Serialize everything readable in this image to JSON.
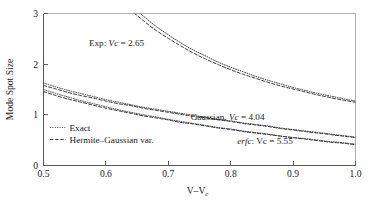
{
  "figure": {
    "background_color": "#ffffff",
    "line_color": "#3a3a3c",
    "axis_color": "#58585a"
  },
  "chart_data": {
    "type": "line",
    "title": "",
    "subtitle": "",
    "xlabel": "V–V",
    "xlabel_sub": "c",
    "ylabel": "Mode Spot Size",
    "xlim": [
      0.5,
      1.0
    ],
    "ylim": [
      0,
      3
    ],
    "grid": false,
    "legend_position": "inside-lower-left",
    "xticks": [
      "0.5",
      "0.6",
      "0.7",
      "0.8",
      "0.9",
      "1.0"
    ],
    "xtick_values": [
      0.5,
      0.6,
      0.7,
      0.8,
      0.9,
      1.0
    ],
    "yticks": [
      "0",
      "1",
      "2",
      "3"
    ],
    "ytick_values": [
      0,
      1,
      2,
      3
    ],
    "series": [
      {
        "name": "Exp: Vc = 2.65 (Exact)",
        "style": "exact",
        "x": [
          0.5,
          0.52,
          0.54,
          0.56,
          0.58,
          0.6,
          0.62,
          0.64,
          0.66,
          0.68,
          0.7,
          0.72,
          0.74,
          0.76,
          0.78,
          0.8,
          0.82,
          0.84,
          0.86,
          0.88,
          0.9,
          0.92,
          0.94,
          0.96,
          0.98,
          1.0
        ],
        "values": [
          6.1,
          5.45,
          4.9,
          4.44,
          4.05,
          3.71,
          3.42,
          3.17,
          2.95,
          2.75,
          2.58,
          2.42,
          2.28,
          2.16,
          2.04,
          1.94,
          1.85,
          1.76,
          1.68,
          1.61,
          1.54,
          1.48,
          1.42,
          1.37,
          1.32,
          1.27
        ]
      },
      {
        "name": "Exp: Vc = 2.65 (Hermite-Gaussian var.)",
        "style": "hermite-gaussian",
        "x": [
          0.5,
          0.52,
          0.54,
          0.56,
          0.58,
          0.6,
          0.62,
          0.64,
          0.66,
          0.68,
          0.7,
          0.72,
          0.74,
          0.76,
          0.78,
          0.8,
          0.82,
          0.84,
          0.86,
          0.88,
          0.9,
          0.92,
          0.94,
          0.96,
          0.98,
          1.0
        ],
        "values": [
          5.85,
          5.24,
          4.72,
          4.28,
          3.91,
          3.59,
          3.32,
          3.07,
          2.86,
          2.67,
          2.51,
          2.36,
          2.22,
          2.1,
          1.99,
          1.89,
          1.8,
          1.72,
          1.64,
          1.57,
          1.51,
          1.45,
          1.39,
          1.34,
          1.29,
          1.25
        ]
      },
      {
        "name": "Gaussian, Vc = 4.04 (Exact)",
        "style": "exact",
        "x": [
          0.5,
          0.52,
          0.54,
          0.56,
          0.58,
          0.6,
          0.62,
          0.64,
          0.66,
          0.68,
          0.7,
          0.72,
          0.74,
          0.76,
          0.78,
          0.8,
          0.82,
          0.84,
          0.86,
          0.88,
          0.9,
          0.92,
          0.94,
          0.96,
          0.98,
          1.0
        ],
        "values": [
          1.63,
          1.55,
          1.48,
          1.42,
          1.36,
          1.3,
          1.25,
          1.2,
          1.15,
          1.11,
          1.07,
          1.03,
          0.99,
          0.95,
          0.91,
          0.88,
          0.84,
          0.81,
          0.78,
          0.74,
          0.71,
          0.68,
          0.65,
          0.62,
          0.59,
          0.56
        ]
      },
      {
        "name": "Gaussian, Vc = 4.04 (Hermite-Gaussian var.)",
        "style": "hermite-gaussian",
        "x": [
          0.5,
          0.52,
          0.54,
          0.56,
          0.58,
          0.6,
          0.62,
          0.64,
          0.66,
          0.68,
          0.7,
          0.72,
          0.74,
          0.76,
          0.78,
          0.8,
          0.82,
          0.84,
          0.86,
          0.88,
          0.9,
          0.92,
          0.94,
          0.96,
          0.98,
          1.0
        ],
        "values": [
          1.58,
          1.51,
          1.44,
          1.38,
          1.33,
          1.27,
          1.22,
          1.18,
          1.13,
          1.09,
          1.05,
          1.01,
          0.97,
          0.94,
          0.9,
          0.87,
          0.83,
          0.8,
          0.77,
          0.73,
          0.7,
          0.67,
          0.64,
          0.61,
          0.58,
          0.55
        ]
      },
      {
        "name": "erfc: Vc = 5.55 (Exact)",
        "style": "exact",
        "x": [
          0.5,
          0.52,
          0.54,
          0.56,
          0.58,
          0.6,
          0.62,
          0.64,
          0.66,
          0.68,
          0.7,
          0.72,
          0.74,
          0.76,
          0.78,
          0.8,
          0.82,
          0.84,
          0.86,
          0.88,
          0.9,
          0.92,
          0.94,
          0.96,
          0.98,
          1.0
        ],
        "values": [
          1.5,
          1.42,
          1.35,
          1.28,
          1.22,
          1.16,
          1.1,
          1.05,
          1.0,
          0.96,
          0.91,
          0.87,
          0.83,
          0.79,
          0.75,
          0.72,
          0.68,
          0.65,
          0.62,
          0.58,
          0.55,
          0.53,
          0.5,
          0.47,
          0.45,
          0.42
        ]
      },
      {
        "name": "erfc: Vc = 5.55 (Hermite-Gaussian var.)",
        "style": "hermite-gaussian",
        "x": [
          0.5,
          0.52,
          0.54,
          0.56,
          0.58,
          0.6,
          0.62,
          0.64,
          0.66,
          0.68,
          0.7,
          0.72,
          0.74,
          0.76,
          0.78,
          0.8,
          0.82,
          0.84,
          0.86,
          0.88,
          0.9,
          0.92,
          0.94,
          0.96,
          0.98,
          1.0
        ],
        "values": [
          1.46,
          1.38,
          1.31,
          1.25,
          1.19,
          1.13,
          1.08,
          1.03,
          0.98,
          0.94,
          0.9,
          0.85,
          0.82,
          0.78,
          0.74,
          0.71,
          0.67,
          0.64,
          0.61,
          0.58,
          0.55,
          0.52,
          0.49,
          0.46,
          0.44,
          0.41
        ]
      }
    ],
    "annotations": [
      {
        "id": "exp",
        "text_prefix": "Exp: ",
        "text_italic": "Vc",
        "text_suffix": " = 2.65",
        "x": 0.617,
        "y": 2.35
      },
      {
        "id": "gaussian",
        "text_prefix": "Gaussian, ",
        "text_italic": "Vc",
        "text_suffix": " = 4.04",
        "x": 0.795,
        "y": 0.9
      },
      {
        "id": "erfc",
        "text_prefix": "",
        "text_italic": "erfc",
        "text_suffix": ": Vc = 5.55",
        "x": 0.855,
        "y": 0.43
      }
    ],
    "legend": [
      {
        "label": "Exact",
        "style": "dotted"
      },
      {
        "label": "Hermite–Gaussian var.",
        "style": "dashed"
      }
    ]
  }
}
